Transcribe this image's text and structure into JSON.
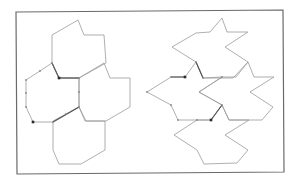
{
  "figure": {
    "frame": [
      [
        16,
        12
      ],
      [
        283,
        10
      ],
      [
        284,
        172
      ],
      [
        17,
        174
      ]
    ],
    "colors": {
      "frame": "#6a6a6a",
      "tile_stroke": "#9a9a9a",
      "bold_edge": "#555555",
      "marker_dark": "#2a2a2a",
      "marker_light": "#8a8a8a"
    },
    "left_panel": {
      "name": "hexagon-tiling",
      "tiles": [
        {
          "name": "top",
          "points": [
            [
              52,
              35
            ],
            [
              78,
              20
            ],
            [
              84,
              35
            ],
            [
              104,
              35
            ],
            [
              106,
              63
            ],
            [
              79,
              78
            ],
            [
              59,
              78
            ],
            [
              52,
              63
            ]
          ]
        },
        {
          "name": "left",
          "points": [
            [
              26,
              80
            ],
            [
              52,
              63
            ],
            [
              59,
              78
            ],
            [
              79,
              78
            ],
            [
              79,
              107
            ],
            [
              53,
              122
            ],
            [
              33,
              122
            ],
            [
              26,
              107
            ]
          ]
        },
        {
          "name": "right",
          "points": [
            [
              79,
              78
            ],
            [
              104,
              63
            ],
            [
              110,
              78
            ],
            [
              130,
              78
            ],
            [
              130,
              107
            ],
            [
              106,
              121
            ],
            [
              86,
              121
            ],
            [
              79,
              107
            ]
          ]
        },
        {
          "name": "bottom",
          "points": [
            [
              53,
              121
            ],
            [
              79,
              107
            ],
            [
              85,
              121
            ],
            [
              105,
              121
            ],
            [
              105,
              150
            ],
            [
              81,
              164
            ],
            [
              59,
              164
            ],
            [
              53,
              150
            ]
          ]
        }
      ],
      "bold_edges": [
        [
          [
            52,
            63
          ],
          [
            59,
            78
          ]
        ],
        [
          [
            59,
            78
          ],
          [
            79,
            78
          ]
        ],
        [
          [
            53,
            122
          ],
          [
            79,
            107
          ]
        ]
      ],
      "dots_dark": [
        [
          59,
          78
        ],
        [
          33,
          122
        ]
      ],
      "dots_light": [
        [
          52,
          63
        ],
        [
          40,
          71
        ],
        [
          26,
          80
        ],
        [
          26,
          93
        ],
        [
          26,
          107
        ],
        [
          79,
          78
        ],
        [
          79,
          92
        ],
        [
          79,
          107
        ],
        [
          53,
          122
        ],
        [
          66,
          114
        ]
      ]
    },
    "right_panel": {
      "name": "star-tiling",
      "tiles": [
        {
          "name": "top",
          "points": [
            [
              172,
              47
            ],
            [
              196,
              33
            ],
            [
              210,
              32
            ],
            [
              222,
              18
            ],
            [
              227,
              32
            ],
            [
              248,
              32
            ],
            [
              225,
              47
            ],
            [
              248,
              62
            ],
            [
              233,
              78
            ],
            [
              203,
              78
            ],
            [
              196,
              62
            ]
          ]
        },
        {
          "name": "left",
          "points": [
            [
              147,
              92
            ],
            [
              171,
              77
            ],
            [
              185,
              77
            ],
            [
              196,
              62
            ],
            [
              203,
              78
            ],
            [
              222,
              77
            ],
            [
              199,
              92
            ],
            [
              222,
              105
            ],
            [
              211,
              120
            ],
            [
              178,
              120
            ],
            [
              171,
              105
            ]
          ]
        },
        {
          "name": "right",
          "points": [
            [
              199,
              92
            ],
            [
              222,
              77
            ],
            [
              236,
              77
            ],
            [
              248,
              62
            ],
            [
              254,
              77
            ],
            [
              274,
              77
            ],
            [
              250,
              92
            ],
            [
              273,
              107
            ],
            [
              262,
              120
            ],
            [
              229,
              120
            ],
            [
              222,
              105
            ]
          ]
        },
        {
          "name": "bottom",
          "points": [
            [
              174,
              135
            ],
            [
              197,
              120
            ],
            [
              211,
              120
            ],
            [
              222,
              105
            ],
            [
              229,
              120
            ],
            [
              249,
              120
            ],
            [
              225,
              135
            ],
            [
              248,
              150
            ],
            [
              237,
              163
            ],
            [
              204,
              164
            ],
            [
              197,
              150
            ]
          ]
        }
      ],
      "bold_edges": [
        [
          [
            196,
            62
          ],
          [
            203,
            78
          ]
        ],
        [
          [
            211,
            120
          ],
          [
            222,
            105
          ]
        ],
        [
          [
            185,
            77
          ],
          [
            171,
            77
          ]
        ]
      ],
      "dots_dark": [
        [
          185,
          77
        ],
        [
          211,
          120
        ]
      ],
      "dots_light": [
        [
          147,
          92
        ],
        [
          171,
          77
        ],
        [
          196,
          62
        ],
        [
          203,
          78
        ],
        [
          222,
          77
        ],
        [
          171,
          105
        ],
        [
          178,
          120
        ],
        [
          197,
          120
        ],
        [
          222,
          105
        ]
      ]
    }
  }
}
